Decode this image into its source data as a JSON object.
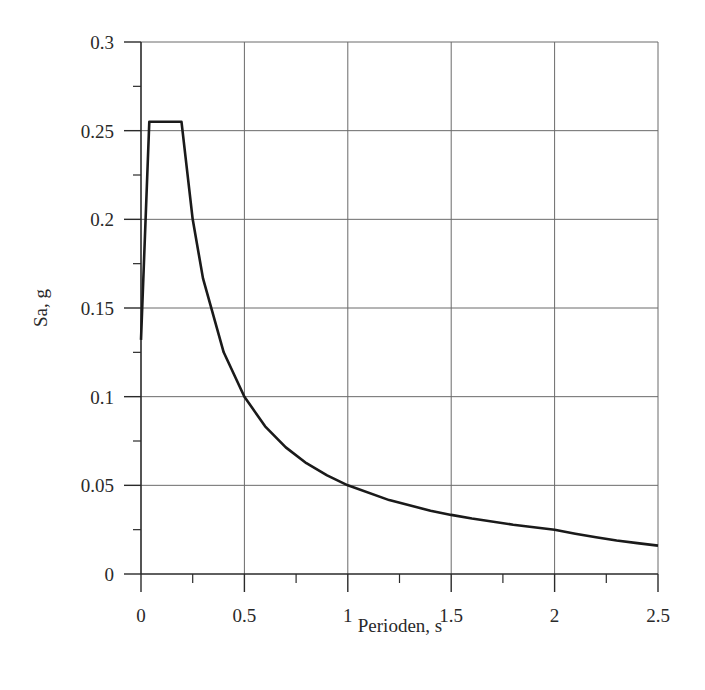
{
  "chart_data": {
    "type": "line",
    "title": "",
    "xlabel": "Perioden, s",
    "ylabel": "Sa, g",
    "xlim": [
      0,
      2.5
    ],
    "ylim": [
      0,
      0.3
    ],
    "grid": true,
    "legend": null,
    "x_ticks": [
      0,
      0.5,
      1,
      1.5,
      2,
      2.5
    ],
    "x_tick_labels": [
      "0",
      "0.5",
      "1",
      "1.5",
      "2",
      "2.5"
    ],
    "x_minor_ticks": [
      0.25,
      0.75,
      1.25,
      1.75,
      2.25
    ],
    "y_ticks": [
      0,
      0.05,
      0.1,
      0.15,
      0.2,
      0.25,
      0.3
    ],
    "y_tick_labels": [
      "0",
      "0.05",
      "0.1",
      "0.15",
      "0.2",
      "0.25",
      "0.3"
    ],
    "y_minor_ticks": [
      0.025,
      0.075,
      0.125,
      0.175,
      0.225,
      0.275
    ],
    "series": [
      {
        "name": "Sa",
        "color": "#1a1a1a",
        "x": [
          0.0,
          0.04,
          0.196,
          0.25,
          0.3,
          0.4,
          0.5,
          0.6,
          0.7,
          0.8,
          0.9,
          1.0,
          1.2,
          1.4,
          1.5,
          1.6,
          1.8,
          2.0,
          2.1,
          2.2,
          2.3,
          2.4,
          2.5
        ],
        "values": [
          0.132,
          0.255,
          0.255,
          0.2,
          0.1667,
          0.125,
          0.1,
          0.0833,
          0.0714,
          0.0625,
          0.0556,
          0.05,
          0.0417,
          0.0357,
          0.0333,
          0.0313,
          0.0278,
          0.025,
          0.0227,
          0.0207,
          0.0189,
          0.0174,
          0.016
        ]
      }
    ]
  }
}
